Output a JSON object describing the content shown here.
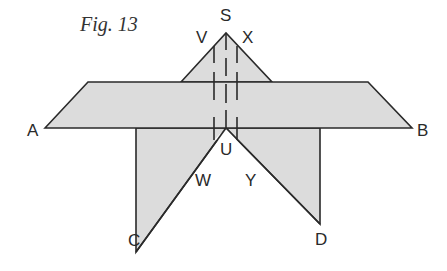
{
  "caption": "Fig. 13",
  "colors": {
    "fill": "#dcdcdc",
    "stroke": "#2a2a2a",
    "background": "#ffffff"
  },
  "labels": {
    "S": "S",
    "V": "V",
    "X": "X",
    "A": "A",
    "B": "B",
    "U": "U",
    "W": "W",
    "Y": "Y",
    "C": "C",
    "D": "D"
  }
}
